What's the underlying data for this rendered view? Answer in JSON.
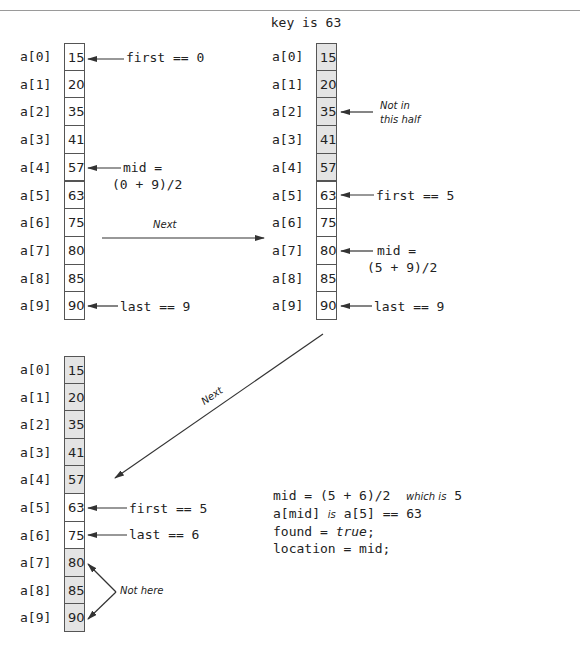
{
  "title": "key is 63",
  "array_label_prefix": "a",
  "step1": {
    "cells": [
      {
        "index": "a[0]",
        "value": "15",
        "shaded": false
      },
      {
        "index": "a[1]",
        "value": "20",
        "shaded": false
      },
      {
        "index": "a[2]",
        "value": "35",
        "shaded": false
      },
      {
        "index": "a[3]",
        "value": "41",
        "shaded": false
      },
      {
        "index": "a[4]",
        "value": "57",
        "shaded": false
      },
      {
        "index": "a[5]",
        "value": "63",
        "shaded": false
      },
      {
        "index": "a[6]",
        "value": "75",
        "shaded": false
      },
      {
        "index": "a[7]",
        "value": "80",
        "shaded": false
      },
      {
        "index": "a[8]",
        "value": "85",
        "shaded": false
      },
      {
        "index": "a[9]",
        "value": "90",
        "shaded": false
      }
    ],
    "first_label": "first == 0",
    "mid_label_1": "mid =",
    "mid_label_2": "(0 + 9)/2",
    "last_label": "last == 9"
  },
  "next_label_1": "Next",
  "step2": {
    "cells": [
      {
        "index": "a[0]",
        "value": "15",
        "shaded": true
      },
      {
        "index": "a[1]",
        "value": "20",
        "shaded": true
      },
      {
        "index": "a[2]",
        "value": "35",
        "shaded": true
      },
      {
        "index": "a[3]",
        "value": "41",
        "shaded": true
      },
      {
        "index": "a[4]",
        "value": "57",
        "shaded": true
      },
      {
        "index": "a[5]",
        "value": "63",
        "shaded": false
      },
      {
        "index": "a[6]",
        "value": "75",
        "shaded": false
      },
      {
        "index": "a[7]",
        "value": "80",
        "shaded": false
      },
      {
        "index": "a[8]",
        "value": "85",
        "shaded": false
      },
      {
        "index": "a[9]",
        "value": "90",
        "shaded": false
      }
    ],
    "not_in_half_1": "Not in",
    "not_in_half_2": "this half",
    "first_label": "first == 5",
    "mid_label_1": "mid =",
    "mid_label_2": "(5 + 9)/2",
    "last_label": "last == 9"
  },
  "next_label_2": "Next",
  "step3": {
    "cells": [
      {
        "index": "a[0]",
        "value": "15",
        "shaded": true
      },
      {
        "index": "a[1]",
        "value": "20",
        "shaded": true
      },
      {
        "index": "a[2]",
        "value": "35",
        "shaded": true
      },
      {
        "index": "a[3]",
        "value": "41",
        "shaded": true
      },
      {
        "index": "a[4]",
        "value": "57",
        "shaded": true
      },
      {
        "index": "a[5]",
        "value": "63",
        "shaded": false
      },
      {
        "index": "a[6]",
        "value": "75",
        "shaded": false
      },
      {
        "index": "a[7]",
        "value": "80",
        "shaded": true
      },
      {
        "index": "a[8]",
        "value": "85",
        "shaded": true
      },
      {
        "index": "a[9]",
        "value": "90",
        "shaded": true
      }
    ],
    "first_label": "first == 5",
    "last_label": "last == 6",
    "not_here": "Not here"
  },
  "result": {
    "line1_code": "mid = (5 + 6)/2",
    "line1_note": "which is",
    "line1_value": "5",
    "line2_a": "a[mid]",
    "line2_note": "is",
    "line2_b": "a[5] == 63",
    "line3_a": "found = ",
    "line3_true": "true",
    "line3_end": ";",
    "line4": "location = mid;"
  },
  "colors": {
    "shaded": "#e4e4e4",
    "line": "#333333",
    "rule": "#9a9a9a"
  }
}
